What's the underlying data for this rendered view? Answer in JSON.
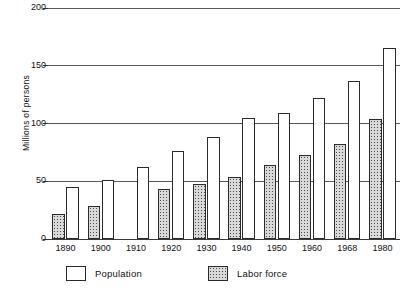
{
  "chart_data": {
    "type": "bar",
    "title": "",
    "xlabel": "",
    "ylabel": "Millions of persons",
    "categories": [
      "1890",
      "1900",
      "1910",
      "1920",
      "1930",
      "1940",
      "1950",
      "1960",
      "1968",
      "1980"
    ],
    "series": [
      {
        "name": "Population",
        "key": "population",
        "color": "#ffffff",
        "values": [
          45,
          51,
          62,
          76,
          88,
          105,
          109,
          122,
          137,
          165
        ]
      },
      {
        "name": "Labor force",
        "key": "labor",
        "color": "#d9d9d9",
        "values": [
          22,
          29,
          null,
          43,
          48,
          54,
          64,
          73,
          82,
          104
        ]
      }
    ],
    "ylim": [
      0,
      200
    ],
    "yticks": [
      0,
      50,
      100,
      150,
      200
    ],
    "ytick_labels": [
      "0",
      "50",
      "100",
      "150",
      "200"
    ],
    "grid": true,
    "legend_position": "bottom-left"
  },
  "legend": {
    "entries": [
      {
        "label": "Population",
        "swatch": "population"
      },
      {
        "label": "Labor force",
        "swatch": "labor"
      }
    ]
  }
}
